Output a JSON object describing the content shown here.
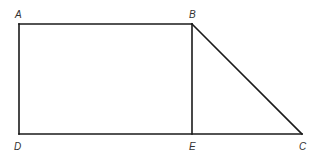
{
  "diagram": {
    "type": "geometry-figure",
    "line_color": "#1a1a1a",
    "label_color": "#333333",
    "points": {
      "A": {
        "label": "A",
        "x": 19,
        "y": 24
      },
      "B": {
        "label": "B",
        "x": 192,
        "y": 24
      },
      "C": {
        "label": "C",
        "x": 302,
        "y": 134
      },
      "D": {
        "label": "D",
        "x": 19,
        "y": 134
      },
      "E": {
        "label": "E",
        "x": 192,
        "y": 134
      }
    },
    "segments": [
      {
        "from": "A",
        "to": "B"
      },
      {
        "from": "A",
        "to": "D"
      },
      {
        "from": "D",
        "to": "C"
      },
      {
        "from": "B",
        "to": "E"
      },
      {
        "from": "B",
        "to": "C"
      }
    ],
    "labels": [
      {
        "text": "A",
        "x": 15,
        "y": 18
      },
      {
        "text": "B",
        "x": 189,
        "y": 18
      },
      {
        "text": "D",
        "x": 14,
        "y": 150
      },
      {
        "text": "E",
        "x": 189,
        "y": 150
      },
      {
        "text": "C",
        "x": 299,
        "y": 150
      }
    ]
  }
}
